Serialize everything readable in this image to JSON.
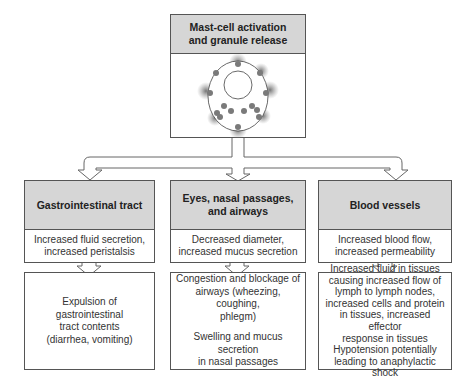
{
  "top": {
    "title_line1": "Mast-cell activation",
    "title_line2": "and granule release",
    "illustration": "mast-cell-degranulation-icon"
  },
  "columns": [
    {
      "header": "Gastrointestinal tract",
      "effect": [
        "Increased fluid secretion,",
        "increased peristalsis"
      ],
      "outcome": [
        [
          "Expulsion of gastrointestinal",
          "tract contents",
          "(diarrhea, vomiting)"
        ]
      ]
    },
    {
      "header_line1": "Eyes, nasal passages,",
      "header_line2": "and airways",
      "effect": [
        "Decreased diameter,",
        "increased mucus secretion"
      ],
      "outcome": [
        [
          "Congestion and blockage of",
          "airways (wheezing, coughing,",
          "phlegm)"
        ],
        [
          "Swelling and mucus secretion",
          "in nasal passages"
        ]
      ]
    },
    {
      "header": "Blood vessels",
      "effect": [
        "Increased blood flow,",
        "increased permeability"
      ],
      "outcome": [
        [
          "Increased fluid in tissues",
          "causing increased flow of",
          "lymph to lymph nodes,",
          "increased cells and protein",
          "in tissues, increased effector",
          "response in tissues",
          "Hypotension potentially",
          "leading to anaphylactic shock"
        ]
      ]
    }
  ],
  "colors": {
    "header_fill": "#d6d6d6",
    "border": "#555555",
    "granule": "#7a7a7a"
  }
}
